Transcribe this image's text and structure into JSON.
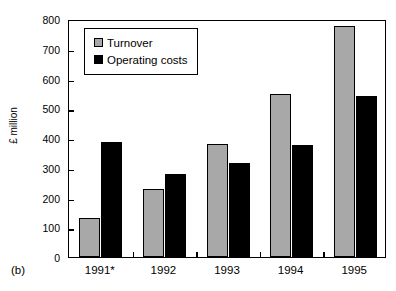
{
  "chart_data": {
    "type": "bar",
    "title": "",
    "panel_label": "(b)",
    "xlabel": "",
    "ylabel": "£ million",
    "categories": [
      "1991*",
      "1992",
      "1993",
      "1994",
      "1995"
    ],
    "series": [
      {
        "name": "Turnover",
        "color": "#a8a8a8",
        "values": [
          130,
          230,
          380,
          548,
          775
        ]
      },
      {
        "name": "Operating costs",
        "color": "#000000",
        "values": [
          385,
          280,
          315,
          378,
          540
        ]
      }
    ],
    "ylim": [
      0,
      800
    ],
    "ytick_step": 100,
    "yticks": [
      0,
      100,
      200,
      300,
      400,
      500,
      600,
      700,
      800
    ],
    "ytick_labels": [
      "0",
      "100",
      "200",
      "300",
      "400",
      "500",
      "600",
      "700",
      "800"
    ],
    "grid": false,
    "legend_position": "upper-left-inside",
    "legend_entries": [
      "Turnover",
      "Operating costs"
    ],
    "footnote_marker": "*"
  }
}
